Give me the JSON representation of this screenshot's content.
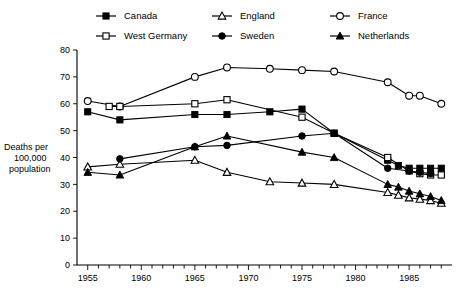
{
  "chart_data": {
    "type": "line",
    "title": "",
    "subtitle": "",
    "xlabel": "",
    "ylabel": "Deaths per 100,000 population",
    "ylabel_lines": [
      "Deaths per",
      "100,000",
      "population"
    ],
    "xlim": [
      1954,
      1989
    ],
    "ylim": [
      0,
      80
    ],
    "ytick_values": [
      0,
      10,
      20,
      30,
      40,
      50,
      60,
      70,
      80
    ],
    "ytick_labels": [
      "0",
      "10",
      "20",
      "30",
      "40",
      "50",
      "60",
      "70",
      "80"
    ],
    "xtick_values": [
      1955,
      1960,
      1965,
      1970,
      1975,
      1980,
      1985
    ],
    "xtick_labels": [
      "1955",
      "1960",
      "1965",
      "1970",
      "1975",
      "1980",
      "1985"
    ],
    "xtick_minor_step": 1,
    "grid": false,
    "legend_position": "top",
    "legend_columns": 3,
    "line_color": "#000000",
    "series": [
      {
        "name": "Canada",
        "marker": "filled-square",
        "x": [
          1955,
          1958,
          1965,
          1968,
          1972,
          1975,
          1978,
          1983,
          1984,
          1985,
          1986,
          1987,
          1988
        ],
        "values": [
          57,
          54,
          56,
          56,
          57,
          58,
          49,
          39,
          37,
          36,
          36,
          36,
          36
        ]
      },
      {
        "name": "England",
        "marker": "open-triangle",
        "x": [
          1955,
          1958,
          1965,
          1968,
          1972,
          1975,
          1978,
          1983,
          1984,
          1985,
          1986,
          1987,
          1988
        ],
        "values": [
          36.5,
          37.5,
          39,
          34.5,
          31,
          30.5,
          30,
          27,
          26,
          25,
          24.5,
          24,
          23
        ]
      },
      {
        "name": "France",
        "marker": "open-circle",
        "x": [
          1955,
          1958,
          1965,
          1968,
          1972,
          1975,
          1978,
          1983,
          1985,
          1986,
          1988
        ],
        "values": [
          61,
          59,
          70,
          73.5,
          73,
          72.5,
          72,
          68,
          63,
          63,
          60
        ]
      },
      {
        "name": "West Germany",
        "marker": "open-square",
        "x": [
          1957,
          1958,
          1965,
          1968,
          1975,
          1978,
          1983,
          1985,
          1986,
          1987,
          1988
        ],
        "values": [
          59,
          59,
          60,
          61.5,
          55,
          49,
          40,
          35,
          34,
          33.5,
          33.5
        ]
      },
      {
        "name": "Sweden",
        "marker": "filled-circle",
        "x": [
          1958,
          1965,
          1968,
          1975,
          1978,
          1983,
          1985,
          1986,
          1987
        ],
        "values": [
          39.5,
          44,
          44.5,
          48,
          49,
          36,
          35,
          34.5,
          34
        ]
      },
      {
        "name": "Netherlands",
        "marker": "filled-triangle",
        "x": [
          1955,
          1958,
          1965,
          1968,
          1975,
          1978,
          1983,
          1984,
          1985,
          1986,
          1987,
          1988
        ],
        "values": [
          34.5,
          33.5,
          44,
          48,
          42,
          40,
          30,
          29,
          27.5,
          26.5,
          25.5,
          24
        ]
      }
    ]
  },
  "legend": {
    "items": [
      {
        "label": "Canada",
        "marker": "filled-square"
      },
      {
        "label": "England",
        "marker": "open-triangle"
      },
      {
        "label": "France",
        "marker": "open-circle"
      },
      {
        "label": "West Germany",
        "marker": "open-square"
      },
      {
        "label": "Sweden",
        "marker": "filled-circle"
      },
      {
        "label": "Netherlands",
        "marker": "filled-triangle"
      }
    ]
  }
}
